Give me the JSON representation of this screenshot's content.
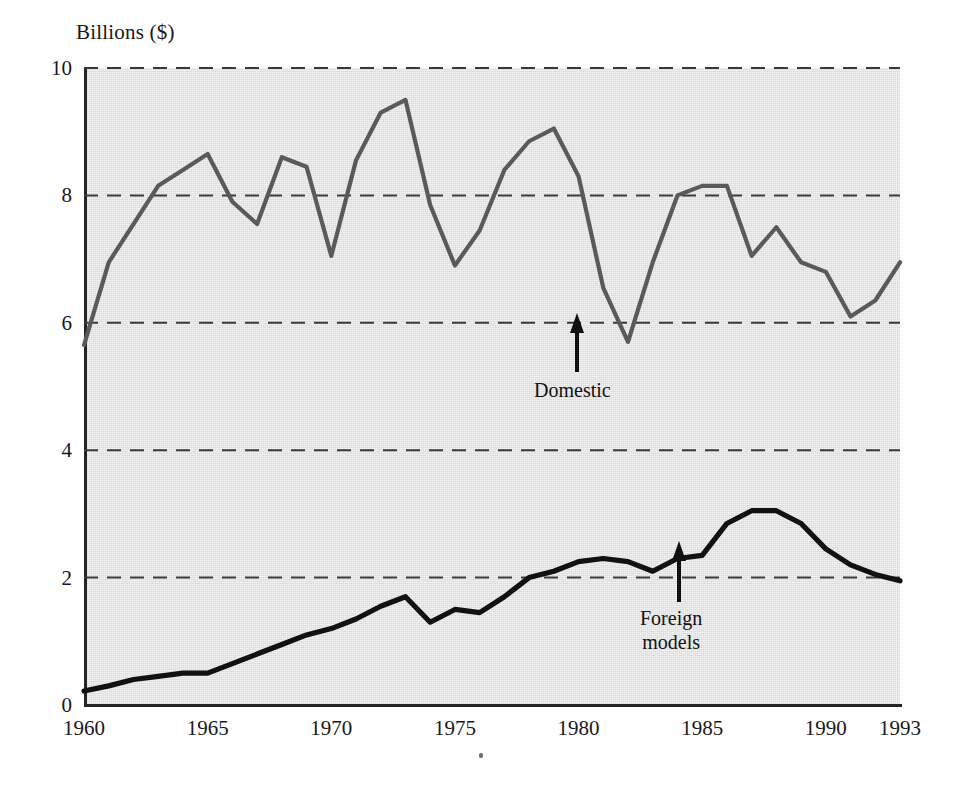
{
  "figure": {
    "background": "#ffffff",
    "plot_background": "#e6e6e6",
    "axis_color": "#242424"
  },
  "axes": {
    "ylabel": "Billions ($)",
    "yticks": [
      "0",
      "2",
      "4",
      "6",
      "8",
      "10"
    ],
    "xticks": [
      "1960",
      "1965",
      "1970",
      "1975",
      "1980",
      "1985",
      "1990",
      "1993"
    ]
  },
  "annotations": [
    {
      "name": "domestic",
      "label": "Domestic",
      "lines": [
        "Domestic"
      ]
    },
    {
      "name": "foreign",
      "label": "Foreign models",
      "lines": [
        "Foreign",
        "models"
      ]
    }
  ],
  "chart_data": {
    "type": "line",
    "title": "",
    "subtitle": "",
    "xlabel": "",
    "ylabel": "Billions ($)",
    "xlim": [
      1960,
      1993
    ],
    "ylim": [
      0,
      10
    ],
    "grid": "horizontal-dashed",
    "gridlines_y": [
      2,
      4,
      6,
      8,
      10
    ],
    "legend": "none (series labelled in-plot with arrows)",
    "x": [
      1960,
      1961,
      1962,
      1963,
      1964,
      1965,
      1966,
      1967,
      1968,
      1969,
      1970,
      1971,
      1972,
      1973,
      1974,
      1975,
      1976,
      1977,
      1978,
      1979,
      1980,
      1981,
      1982,
      1983,
      1984,
      1985,
      1986,
      1987,
      1988,
      1989,
      1990,
      1991,
      1992,
      1993
    ],
    "series": [
      {
        "name": "Domestic",
        "color": "#5a5a5a",
        "annotation": "Domestic",
        "annotation_year": 1981,
        "values": [
          5.65,
          6.95,
          7.55,
          8.15,
          8.4,
          8.65,
          7.9,
          7.55,
          8.6,
          8.45,
          7.05,
          8.55,
          9.3,
          9.5,
          7.85,
          6.9,
          7.45,
          8.4,
          8.85,
          9.05,
          8.3,
          6.55,
          5.7,
          6.95,
          8.0,
          8.15,
          8.15,
          7.05,
          7.5,
          6.95,
          6.8,
          6.1,
          6.35,
          6.95
        ]
      },
      {
        "name": "Foreign models",
        "color": "#111111",
        "annotation": "Foreign models",
        "annotation_year": 1985,
        "values": [
          0.22,
          0.3,
          0.4,
          0.45,
          0.5,
          0.5,
          0.65,
          0.8,
          0.95,
          1.1,
          1.2,
          1.35,
          1.55,
          1.7,
          1.3,
          1.5,
          1.45,
          1.7,
          2.0,
          2.1,
          2.25,
          2.3,
          2.25,
          2.1,
          2.3,
          2.35,
          2.85,
          3.05,
          3.05,
          2.85,
          2.45,
          2.2,
          2.05,
          1.95
        ]
      }
    ]
  }
}
